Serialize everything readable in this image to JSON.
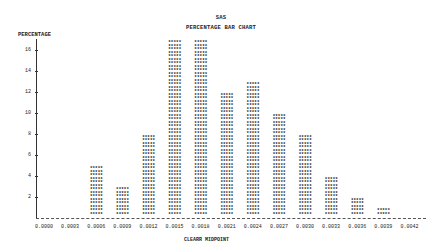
{
  "header": {
    "title_line1": "SAS",
    "title_line2": "PERCENTAGE BAR CHART"
  },
  "chart_data": {
    "type": "bar",
    "title": "PERCENTAGE BAR CHART",
    "subtitle": "SAS",
    "xlabel": "CLEARR MIDPOINT",
    "ylabel": "PERCENTAGE",
    "categories": [
      "0.0000",
      "0.0003",
      "0.0006",
      "0.0009",
      "0.0012",
      "0.0015",
      "0.0018",
      "0.0021",
      "0.0024",
      "0.0027",
      "0.0030",
      "0.0033",
      "0.0036",
      "0.0039",
      "0.0042"
    ],
    "values": [
      0,
      0,
      5,
      3,
      8,
      17,
      17,
      12,
      13,
      10,
      8,
      4,
      2,
      1,
      0
    ],
    "yticks": [
      2,
      4,
      6,
      8,
      10,
      12,
      14,
      16
    ],
    "ylim": [
      0,
      17
    ],
    "bar_symbol": "*****",
    "grid": false,
    "legend": null
  }
}
